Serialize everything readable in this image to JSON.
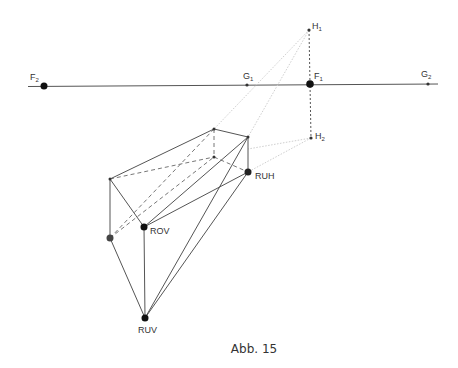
{
  "caption": "Abb. 15",
  "labels": {
    "F2": {
      "main": "F",
      "sub": "2"
    },
    "G1": {
      "main": "G",
      "sub": "1"
    },
    "F1": {
      "main": "F",
      "sub": "1"
    },
    "G2": {
      "main": "G",
      "sub": "2"
    },
    "H1": {
      "main": "H",
      "sub": "1"
    },
    "H2": {
      "main": "H",
      "sub": "2"
    },
    "RUH": "RUH",
    "ROV": "ROV",
    "RUV": "RUV"
  },
  "colors": {
    "line": "#555555",
    "dashed": "#777777",
    "construction": "#c8c8c8",
    "point": "#111111"
  }
}
